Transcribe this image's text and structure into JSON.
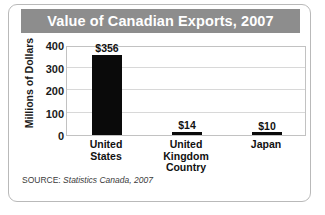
{
  "chart_data": {
    "type": "bar",
    "title": "Value of Canadian Exports, 2007",
    "categories": [
      "United States",
      "United Kingdom",
      "Japan"
    ],
    "category_lines": [
      [
        "United",
        "States"
      ],
      [
        "United",
        "Kingdom"
      ],
      [
        "Japan"
      ]
    ],
    "values": [
      356,
      14,
      10
    ],
    "value_labels": [
      "$356",
      "$14",
      "$10"
    ],
    "xlabel": "Country",
    "ylabel": "Millions of Dollars",
    "ylim": [
      0,
      400
    ],
    "ytick_values": [
      400,
      300,
      200,
      100,
      0
    ],
    "ytick_labels": [
      "400",
      "300",
      "200",
      "100",
      "0"
    ],
    "grid": true,
    "legend": "none",
    "bar_color": "#0a0a0a",
    "gridline_color": "#d8d8d8",
    "title_bar_color": "#8d8d8d",
    "title_text_color": "#ffffff"
  },
  "source": {
    "label": "SOURCE:",
    "attribution": "Statistics Canada, 2007"
  }
}
